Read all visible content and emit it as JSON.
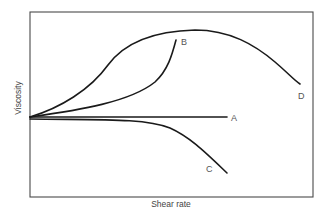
{
  "figure": {
    "type": "qualitative viscosity vs shear rate diagram",
    "x_axis_label": "Shear rate",
    "y_axis_label": "Viscosity",
    "curves": [
      {
        "id": "A",
        "label": "A",
        "description": "Newtonian — constant viscosity (horizontal line)"
      },
      {
        "id": "B",
        "label": "B",
        "description": "Shear thickening — viscosity rises steeply with shear rate"
      },
      {
        "id": "C",
        "label": "C",
        "description": "Shear thinning — viscosity decreases with shear rate"
      },
      {
        "id": "D",
        "label": "D",
        "description": "Viscosity rises to a maximum then decreases"
      }
    ]
  },
  "colors": {
    "frame": "#4a4a4a",
    "curve": "#1a1a1a",
    "label": "#555555",
    "background": "#ffffff"
  }
}
